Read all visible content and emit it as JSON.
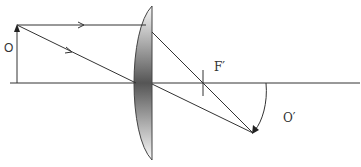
{
  "diagram": {
    "type": "ray-diagram",
    "labels": {
      "object": "O",
      "focal_point": "F′",
      "image": "O′"
    },
    "elements": [
      {
        "name": "optical-axis",
        "description": "horizontal principal axis"
      },
      {
        "name": "object-arrow",
        "description": "upright object arrow O left of lens"
      },
      {
        "name": "lens",
        "description": "plano-convex converging lens, flat side right"
      },
      {
        "name": "ray-parallel",
        "description": "ray parallel to axis, refracted through F′"
      },
      {
        "name": "ray-central",
        "description": "ray through optical center, undeviated"
      },
      {
        "name": "focal-mark",
        "description": "tick mark at F′"
      },
      {
        "name": "image-arrow",
        "description": "inverted real image O′, curved arrow"
      }
    ],
    "colors": {
      "line": "#333333",
      "lens_dark": "#5a5a5a",
      "lens_light": "#f2f2f2"
    }
  }
}
